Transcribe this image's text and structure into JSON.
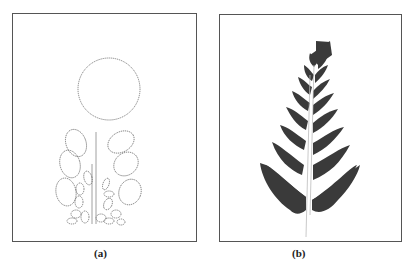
{
  "figure": {
    "panels": [
      {
        "id": "a",
        "label": "(a)",
        "content": "fern-construction-ellipses",
        "description": "Fractal fern construction shown as dotted ellipses and circle with vertical stem"
      },
      {
        "id": "b",
        "label": "(b)",
        "content": "filled-fern-fractal",
        "description": "Filled Barnsley-style fern fractal in dark gray"
      }
    ],
    "colors": {
      "stroke": "#555555",
      "fern_fill": "#3a3a3a",
      "background": "#ffffff"
    }
  }
}
